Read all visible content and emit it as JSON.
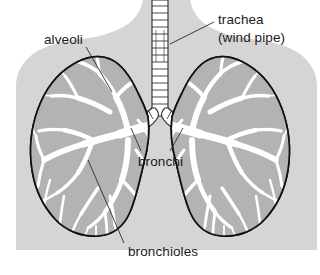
{
  "figure": {
    "background_color": "#ffffff",
    "body_silhouette_color": "#d5d5d5",
    "lung_fill_color": "#ffffff",
    "alveoli_tissue_color": "#b3b3b3",
    "outline_color": "#111111",
    "label_color": "#1a1a1a"
  },
  "labels": {
    "alveoli": "alveoli",
    "trachea_line1": "trachea",
    "trachea_line2": "(wind pipe)",
    "bronchi": "bronchi",
    "bronchioles": "bronchioles"
  },
  "parts": [
    {
      "name": "trachea",
      "label": "trachea (wind pipe)",
      "description": "ringed tube descending from top centre"
    },
    {
      "name": "bronchi",
      "label": "bronchi",
      "description": "two ringed branches from the trachea into each lung"
    },
    {
      "name": "bronchioles",
      "label": "bronchioles",
      "description": "white branching network inside the lungs"
    },
    {
      "name": "alveoli",
      "label": "alveoli",
      "description": "grey tissue between the airway branches"
    },
    {
      "name": "left-lung",
      "label": "",
      "description": "lung on the left of the image"
    },
    {
      "name": "right-lung",
      "label": "",
      "description": "lung on the right of the image"
    }
  ]
}
